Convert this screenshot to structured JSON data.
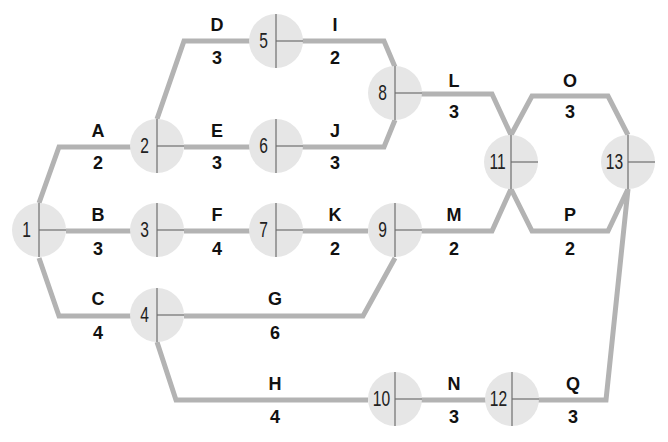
{
  "diagram": {
    "type": "activity-on-arrow network",
    "colors": {
      "edge": "#b3b3b3",
      "node_fill": "#e6e6e6",
      "node_divider": "#6e6e6e",
      "text": "#111111",
      "background": "#ffffff"
    },
    "nodes": [
      {
        "id": "1",
        "label": "1",
        "x": 39,
        "y": 230
      },
      {
        "id": "2",
        "label": "2",
        "x": 157,
        "y": 146
      },
      {
        "id": "3",
        "label": "3",
        "x": 157,
        "y": 230
      },
      {
        "id": "4",
        "label": "4",
        "x": 157,
        "y": 315
      },
      {
        "id": "5",
        "label": "5",
        "x": 276,
        "y": 41
      },
      {
        "id": "6",
        "label": "6",
        "x": 276,
        "y": 146
      },
      {
        "id": "7",
        "label": "7",
        "x": 276,
        "y": 230
      },
      {
        "id": "8",
        "label": "8",
        "x": 395,
        "y": 93
      },
      {
        "id": "9",
        "label": "9",
        "x": 395,
        "y": 230
      },
      {
        "id": "10",
        "label": "10",
        "x": 395,
        "y": 399
      },
      {
        "id": "11",
        "label": "11",
        "x": 511,
        "y": 162
      },
      {
        "id": "12",
        "label": "12",
        "x": 512,
        "y": 399
      },
      {
        "id": "13",
        "label": "13",
        "x": 628,
        "y": 162
      }
    ],
    "edges": [
      {
        "name": "A",
        "duration": "2",
        "from": "1",
        "to": "2",
        "points": "39,203 59,147 131,147",
        "lx": 98,
        "ly": 131,
        "dy": 163
      },
      {
        "name": "B",
        "duration": "3",
        "from": "1",
        "to": "3",
        "points": "66,231 131,231",
        "lx": 98,
        "ly": 215,
        "dy": 249
      },
      {
        "name": "C",
        "duration": "4",
        "from": "1",
        "to": "4",
        "points": "39,258 59,316 131,316",
        "lx": 98,
        "ly": 299,
        "dy": 333
      },
      {
        "name": "D",
        "duration": "3",
        "from": "2",
        "to": "5",
        "points": "157,119 184,41 250,41",
        "lx": 217,
        "ly": 25,
        "dy": 58
      },
      {
        "name": "E",
        "duration": "3",
        "from": "2",
        "to": "6",
        "points": "184,147 250,147",
        "lx": 217,
        "ly": 131,
        "dy": 163
      },
      {
        "name": "F",
        "duration": "4",
        "from": "3",
        "to": "7",
        "points": "184,231 250,231",
        "lx": 217,
        "ly": 215,
        "dy": 249
      },
      {
        "name": "G",
        "duration": "6",
        "from": "4",
        "to": "9",
        "points": "184,316 363,316 395,258",
        "lx": 275,
        "ly": 299,
        "dy": 333
      },
      {
        "name": "H",
        "duration": "4",
        "from": "4",
        "to": "10",
        "points": "157,342 176,400 368,400",
        "lx": 275,
        "ly": 384,
        "dy": 417
      },
      {
        "name": "I",
        "duration": "2",
        "from": "5",
        "to": "8",
        "points": "302,41 384,41 395,67",
        "lx": 335,
        "ly": 25,
        "dy": 58
      },
      {
        "name": "J",
        "duration": "3",
        "from": "6",
        "to": "8",
        "points": "302,147 384,147 395,120",
        "lx": 335,
        "ly": 131,
        "dy": 163
      },
      {
        "name": "K",
        "duration": "2",
        "from": "7",
        "to": "9",
        "points": "302,231 368,231",
        "lx": 335,
        "ly": 215,
        "dy": 249
      },
      {
        "name": "L",
        "duration": "3",
        "from": "8",
        "to": "11",
        "points": "421,94 492,94 511,135",
        "lx": 454,
        "ly": 81,
        "dy": 112
      },
      {
        "name": "M",
        "duration": "2",
        "from": "9",
        "to": "11",
        "points": "421,231 492,231 511,189",
        "lx": 454,
        "ly": 215,
        "dy": 249
      },
      {
        "name": "N",
        "duration": "3",
        "from": "10",
        "to": "12",
        "points": "421,400 486,400",
        "lx": 454,
        "ly": 384,
        "dy": 417
      },
      {
        "name": "O",
        "duration": "3",
        "from": "11",
        "to": "13",
        "points": "511,135 532,96 608,96 628,135",
        "lx": 570,
        "ly": 81,
        "dy": 112
      },
      {
        "name": "P",
        "duration": "2",
        "from": "11",
        "to": "13",
        "points": "511,189 532,231 608,231 628,189",
        "lx": 570,
        "ly": 215,
        "dy": 249
      },
      {
        "name": "Q",
        "duration": "3",
        "from": "12",
        "to": "13",
        "points": "538,400 606,400 628,189",
        "lx": 573,
        "ly": 384,
        "dy": 417
      }
    ]
  }
}
